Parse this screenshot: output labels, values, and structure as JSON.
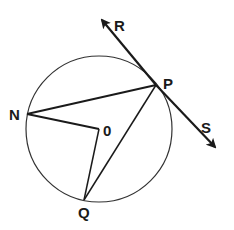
{
  "diagram": {
    "type": "circle-geometry",
    "circle": {
      "center_label": "0",
      "cx": 99,
      "cy": 129,
      "r": 73
    },
    "points": {
      "P": {
        "label": "P",
        "x": 156,
        "y": 85
      },
      "N": {
        "label": "N",
        "x": 27,
        "y": 114
      },
      "O": {
        "label": "0",
        "x": 99,
        "y": 129
      },
      "Q": {
        "label": "Q",
        "x": 84,
        "y": 200
      },
      "R": {
        "label": "R",
        "x": 101,
        "y": 18
      },
      "S": {
        "label": "S",
        "x": 216,
        "y": 148
      }
    },
    "segments": [
      "NP",
      "NO",
      "OQ",
      "QP"
    ],
    "tangent_line": {
      "through": "P",
      "arrows": [
        "R",
        "S"
      ]
    },
    "colors": {
      "stroke": "#1a1a1a",
      "background": "#ffffff"
    }
  },
  "labels": {
    "R": "R",
    "P": "P",
    "N": "N",
    "O": "0",
    "S": "S",
    "Q": "Q"
  }
}
